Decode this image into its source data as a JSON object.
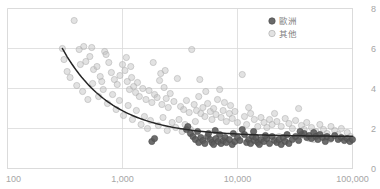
{
  "chart_data": {
    "type": "scatter",
    "title": "",
    "xlabel": "",
    "ylabel": "",
    "xscale": "log",
    "xlim": [
      100,
      100000
    ],
    "ylim": [
      0,
      8
    ],
    "xticks": [
      100,
      1000,
      10000,
      100000
    ],
    "xticklabels": [
      "100",
      "1,000",
      "10,000",
      "100,000"
    ],
    "yticks": [
      0,
      2,
      4,
      6,
      8
    ],
    "yticklabels": [
      "0",
      "2",
      "4",
      "6",
      "8"
    ],
    "y_axis_side": "right",
    "grid": true,
    "legend_position": "top-right",
    "series": [
      {
        "name": "歐洲",
        "color": "#595959",
        "marker": "filled-circle",
        "points": [
          [
            1800,
            1.35
          ],
          [
            1900,
            1.5
          ],
          [
            3600,
            1.95
          ],
          [
            3700,
            2.1
          ],
          [
            3900,
            1.75
          ],
          [
            4100,
            1.6
          ],
          [
            4300,
            1.45
          ],
          [
            4600,
            1.3
          ],
          [
            4800,
            1.55
          ],
          [
            5000,
            1.4
          ],
          [
            5200,
            1.25
          ],
          [
            5500,
            1.6
          ],
          [
            5800,
            1.45
          ],
          [
            6000,
            1.3
          ],
          [
            6200,
            1.2
          ],
          [
            6500,
            1.5
          ],
          [
            6800,
            1.35
          ],
          [
            7000,
            1.7
          ],
          [
            7200,
            1.25
          ],
          [
            7500,
            1.4
          ],
          [
            7800,
            1.55
          ],
          [
            8000,
            1.3
          ],
          [
            8500,
            1.45
          ],
          [
            9000,
            1.2
          ],
          [
            9500,
            1.35
          ],
          [
            10000,
            1.55
          ],
          [
            10500,
            1.4
          ],
          [
            11000,
            1.95
          ],
          [
            11500,
            1.7
          ],
          [
            12000,
            1.3
          ],
          [
            12500,
            1.45
          ],
          [
            13000,
            1.25
          ],
          [
            13500,
            1.6
          ],
          [
            14000,
            1.4
          ],
          [
            14500,
            1.55
          ],
          [
            15000,
            1.3
          ],
          [
            15500,
            1.2
          ],
          [
            16000,
            1.45
          ],
          [
            17000,
            1.35
          ],
          [
            18000,
            1.5
          ],
          [
            19000,
            1.25
          ],
          [
            20000,
            1.6
          ],
          [
            21000,
            1.4
          ],
          [
            22000,
            1.3
          ],
          [
            23000,
            1.45
          ],
          [
            24000,
            1.2
          ],
          [
            25000,
            1.55
          ],
          [
            26000,
            1.35
          ],
          [
            28000,
            1.25
          ],
          [
            30000,
            1.45
          ],
          [
            32000,
            1.6
          ],
          [
            34000,
            1.4
          ],
          [
            36000,
            1.7
          ],
          [
            38000,
            1.75
          ],
          [
            40000,
            1.55
          ],
          [
            42000,
            1.65
          ],
          [
            44000,
            1.5
          ],
          [
            46000,
            1.8
          ],
          [
            48000,
            1.6
          ],
          [
            50000,
            1.45
          ],
          [
            52000,
            1.7
          ],
          [
            55000,
            1.55
          ],
          [
            58000,
            1.35
          ],
          [
            60000,
            1.6
          ],
          [
            65000,
            1.5
          ],
          [
            70000,
            1.65
          ],
          [
            75000,
            1.45
          ],
          [
            80000,
            1.55
          ],
          [
            85000,
            1.4
          ],
          [
            90000,
            1.5
          ],
          [
            95000,
            1.35
          ],
          [
            100000,
            1.45
          ],
          [
            4500,
            1.85
          ],
          [
            5600,
            1.75
          ],
          [
            6400,
            1.9
          ],
          [
            9200,
            1.75
          ],
          [
            13800,
            1.85
          ],
          [
            17500,
            1.65
          ],
          [
            27000,
            1.7
          ],
          [
            35000,
            1.85
          ]
        ]
      },
      {
        "name": "其他",
        "color": "#bfbfbf",
        "marker": "open-circle",
        "points": [
          [
            380,
            7.4
          ],
          [
            300,
            6.0
          ],
          [
            420,
            5.95
          ],
          [
            430,
            5.2
          ],
          [
            480,
            5.35
          ],
          [
            520,
            5.6
          ],
          [
            560,
            4.95
          ],
          [
            600,
            5.1
          ],
          [
            640,
            4.6
          ],
          [
            700,
            5.85
          ],
          [
            720,
            5.7
          ],
          [
            760,
            5.3
          ],
          [
            800,
            4.8
          ],
          [
            850,
            4.45
          ],
          [
            900,
            4.2
          ],
          [
            950,
            4.65
          ],
          [
            1000,
            5.2
          ],
          [
            1050,
            4.9
          ],
          [
            1100,
            4.35
          ],
          [
            1150,
            3.95
          ],
          [
            1200,
            4.55
          ],
          [
            1250,
            4.1
          ],
          [
            1300,
            3.8
          ],
          [
            1350,
            4.3
          ],
          [
            1400,
            3.6
          ],
          [
            1500,
            4.0
          ],
          [
            1600,
            3.45
          ],
          [
            1700,
            3.9
          ],
          [
            1800,
            3.3
          ],
          [
            1900,
            3.7
          ],
          [
            2000,
            3.55
          ],
          [
            2100,
            4.4
          ],
          [
            2200,
            3.2
          ],
          [
            2300,
            4.05
          ],
          [
            2400,
            3.5
          ],
          [
            2500,
            3.05
          ],
          [
            2600,
            3.75
          ],
          [
            2800,
            3.35
          ],
          [
            3000,
            4.5
          ],
          [
            3200,
            3.1
          ],
          [
            3400,
            2.95
          ],
          [
            3600,
            3.4
          ],
          [
            3800,
            2.8
          ],
          [
            4000,
            5.95
          ],
          [
            4200,
            3.2
          ],
          [
            4400,
            2.9
          ],
          [
            4600,
            3.6
          ],
          [
            4800,
            2.75
          ],
          [
            5000,
            3.05
          ],
          [
            5200,
            2.6
          ],
          [
            5500,
            3.25
          ],
          [
            5800,
            2.85
          ],
          [
            6000,
            2.45
          ],
          [
            6200,
            3.0
          ],
          [
            6500,
            2.7
          ],
          [
            7000,
            3.95
          ],
          [
            7200,
            2.55
          ],
          [
            7500,
            2.9
          ],
          [
            8000,
            2.35
          ],
          [
            8500,
            2.75
          ],
          [
            9000,
            2.5
          ],
          [
            9500,
            2.85
          ],
          [
            10000,
            2.3
          ],
          [
            11000,
            4.7
          ],
          [
            11500,
            2.6
          ],
          [
            12000,
            2.2
          ],
          [
            13000,
            2.75
          ],
          [
            14000,
            2.45
          ],
          [
            15000,
            2.1
          ],
          [
            16000,
            2.55
          ],
          [
            17000,
            2.3
          ],
          [
            18000,
            2.05
          ],
          [
            19000,
            2.45
          ],
          [
            20000,
            2.2
          ],
          [
            21000,
            2.75
          ],
          [
            22000,
            2.35
          ],
          [
            24000,
            2.1
          ],
          [
            26000,
            2.5
          ],
          [
            28000,
            2.25
          ],
          [
            30000,
            2.0
          ],
          [
            32000,
            2.4
          ],
          [
            34000,
            3.0
          ],
          [
            36000,
            2.15
          ],
          [
            38000,
            1.95
          ],
          [
            40000,
            2.3
          ],
          [
            44000,
            2.05
          ],
          [
            48000,
            1.85
          ],
          [
            52000,
            2.2
          ],
          [
            56000,
            1.95
          ],
          [
            60000,
            1.75
          ],
          [
            65000,
            2.1
          ],
          [
            70000,
            1.9
          ],
          [
            75000,
            1.7
          ],
          [
            80000,
            2.0
          ],
          [
            90000,
            1.8
          ],
          [
            350,
            4.55
          ],
          [
            400,
            4.15
          ],
          [
            450,
            3.85
          ],
          [
            500,
            3.45
          ],
          [
            550,
            4.25
          ],
          [
            620,
            3.6
          ],
          [
            680,
            3.95
          ],
          [
            740,
            3.25
          ],
          [
            820,
            3.7
          ],
          [
            880,
            2.95
          ],
          [
            940,
            3.4
          ],
          [
            1020,
            2.65
          ],
          [
            1120,
            3.15
          ],
          [
            1220,
            2.45
          ],
          [
            1320,
            2.9
          ],
          [
            1450,
            2.2
          ],
          [
            1550,
            2.6
          ],
          [
            1650,
            2.0
          ],
          [
            1750,
            2.4
          ],
          [
            1850,
            5.3
          ],
          [
            2050,
            2.15
          ],
          [
            2250,
            2.55
          ],
          [
            2450,
            1.9
          ],
          [
            2700,
            2.3
          ],
          [
            2900,
            2.05
          ],
          [
            3100,
            2.45
          ],
          [
            3300,
            1.85
          ],
          [
            3500,
            2.2
          ],
          [
            3900,
            1.95
          ],
          [
            4300,
            2.35
          ],
          [
            310,
            5.45
          ],
          [
            330,
            4.85
          ],
          [
            460,
            6.1
          ],
          [
            540,
            6.05
          ],
          [
            660,
            4.35
          ],
          [
            1080,
            5.55
          ],
          [
            1180,
            5.1
          ],
          [
            2150,
            4.75
          ],
          [
            2350,
            4.9
          ],
          [
            4700,
            4.45
          ],
          [
            5300,
            3.85
          ],
          [
            6700,
            3.45
          ],
          [
            7700,
            3.3
          ],
          [
            8700,
            3.15
          ],
          [
            12500,
            3.05
          ],
          [
            23000,
            1.6
          ],
          [
            27000,
            1.55
          ],
          [
            35000,
            1.6
          ],
          [
            42000,
            1.5
          ],
          [
            58000,
            1.55
          ],
          [
            46000,
            1.45
          ],
          [
            50000,
            1.65
          ],
          [
            64000,
            1.45
          ],
          [
            78000,
            1.5
          ],
          [
            96000,
            1.6
          ]
        ]
      }
    ],
    "trendline": {
      "name": "power-trend",
      "color": "#262626",
      "x_start": 300,
      "x_end": 100000,
      "y_start": 6.0,
      "y_end": 1.62,
      "form": "power-decay"
    }
  },
  "legend": {
    "entries": [
      {
        "label": "歐洲",
        "color": "#595959",
        "marker": "filled-circle"
      },
      {
        "label": "其他",
        "color": "#bfbfbf",
        "marker": "open-circle"
      }
    ]
  },
  "colors": {
    "europe": "#595959",
    "other": "#bfbfbf",
    "gridline": "#d9d9d9",
    "axis_text": "#a6a6a6",
    "trendline": "#262626",
    "background": "#ffffff"
  }
}
